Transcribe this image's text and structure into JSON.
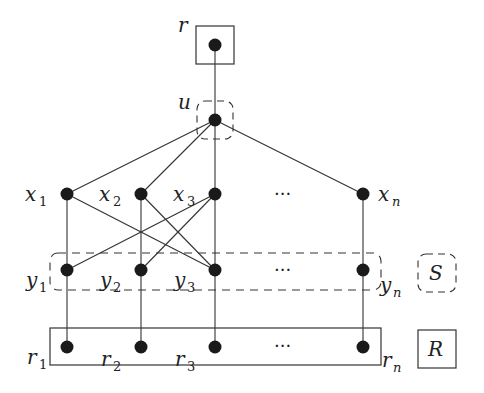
{
  "diagram": {
    "nodes": {
      "r": {
        "label": "r",
        "sub": ""
      },
      "u": {
        "label": "u",
        "sub": ""
      },
      "x": [
        {
          "label": "x",
          "sub": "1"
        },
        {
          "label": "x",
          "sub": "2"
        },
        {
          "label": "x",
          "sub": "3"
        },
        {
          "label": "x",
          "sub": "n"
        }
      ],
      "y": [
        {
          "label": "y",
          "sub": "1"
        },
        {
          "label": "y",
          "sub": "2"
        },
        {
          "label": "y",
          "sub": "3"
        },
        {
          "label": "y",
          "sub": "n"
        }
      ],
      "rr": [
        {
          "label": "r",
          "sub": "1"
        },
        {
          "label": "r",
          "sub": "2"
        },
        {
          "label": "r",
          "sub": "3"
        },
        {
          "label": "r",
          "sub": "n"
        }
      ]
    },
    "ellipsis": "···",
    "sets": {
      "S": "S",
      "R": "R"
    },
    "edges": [
      [
        "r",
        "u"
      ],
      [
        "u",
        "x1"
      ],
      [
        "u",
        "x2"
      ],
      [
        "u",
        "x3"
      ],
      [
        "u",
        "xn"
      ],
      [
        "x1",
        "y1"
      ],
      [
        "x2",
        "y2"
      ],
      [
        "x3",
        "y3"
      ],
      [
        "xn",
        "yn"
      ],
      [
        "x1",
        "y3"
      ],
      [
        "x2",
        "y3"
      ],
      [
        "x3",
        "y1"
      ],
      [
        "x3",
        "y2"
      ],
      [
        "y1",
        "r1"
      ],
      [
        "y2",
        "r2"
      ],
      [
        "y3",
        "r3"
      ],
      [
        "yn",
        "rn"
      ]
    ],
    "colors": {
      "node": "#1a1a1a",
      "edge": "#333333",
      "box": "#333333"
    }
  }
}
